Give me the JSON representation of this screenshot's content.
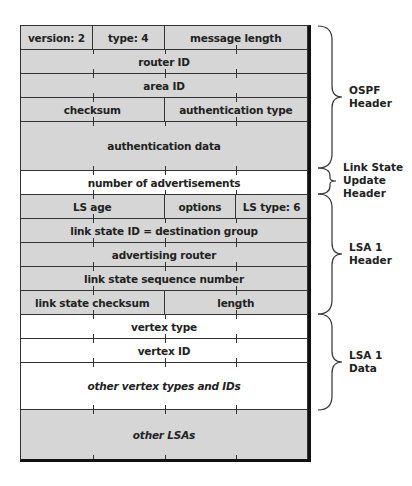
{
  "diagram": {
    "rows": [
      {
        "height": 24,
        "fill": "gray",
        "cells": [
          {
            "label": "version: 2",
            "span": 1
          },
          {
            "label": "type: 4",
            "span": 1
          },
          {
            "label": "message length",
            "span": 2
          }
        ]
      },
      {
        "height": 24,
        "fill": "gray",
        "cells": [
          {
            "label": "router ID",
            "span": 4
          }
        ]
      },
      {
        "height": 24,
        "fill": "gray",
        "cells": [
          {
            "label": "area ID",
            "span": 4
          }
        ]
      },
      {
        "height": 24,
        "fill": "gray",
        "cells": [
          {
            "label": "checksum",
            "span": 2
          },
          {
            "label": "authentication type",
            "span": 2
          }
        ]
      },
      {
        "height": 49,
        "fill": "gray",
        "cells": [
          {
            "label": "authentication data",
            "span": 4
          }
        ]
      },
      {
        "height": 24,
        "fill": "white",
        "cells": [
          {
            "label": "number of advertisements",
            "span": 4
          }
        ]
      },
      {
        "height": 24,
        "fill": "gray",
        "cells": [
          {
            "label": "LS age",
            "span": 2
          },
          {
            "label": "options",
            "span": 1
          },
          {
            "label": "LS type: 6",
            "span": 1
          }
        ]
      },
      {
        "height": 24,
        "fill": "gray",
        "cells": [
          {
            "label": "link state ID = destination group",
            "span": 4
          }
        ]
      },
      {
        "height": 24,
        "fill": "gray",
        "cells": [
          {
            "label": "advertising router",
            "span": 4
          }
        ]
      },
      {
        "height": 24,
        "fill": "gray",
        "cells": [
          {
            "label": "link state sequence number",
            "span": 4
          }
        ]
      },
      {
        "height": 24,
        "fill": "gray",
        "cells": [
          {
            "label": "link state checksum",
            "span": 2
          },
          {
            "label": "length",
            "span": 2
          }
        ]
      },
      {
        "height": 24,
        "fill": "white",
        "cells": [
          {
            "label": "vertex type",
            "span": 4
          }
        ]
      },
      {
        "height": 24,
        "fill": "white",
        "cells": [
          {
            "label": "vertex ID",
            "span": 4
          }
        ]
      },
      {
        "height": 47,
        "fill": "white",
        "cells": [
          {
            "label": "other vertex types and IDs",
            "span": 4,
            "italic": true
          }
        ]
      },
      {
        "height": 49,
        "fill": "gray",
        "cells": [
          {
            "label": "other LSAs",
            "span": 4,
            "italic": true
          }
        ]
      }
    ],
    "braces": [
      {
        "label_line1": "OSPF",
        "label_line2": "Header",
        "label_line3": ""
      },
      {
        "label_line1": "Link State",
        "label_line2": "Update",
        "label_line3": "Header"
      },
      {
        "label_line1": "LSA 1",
        "label_line2": "Header",
        "label_line3": ""
      },
      {
        "label_line1": "LSA 1",
        "label_line2": "Data",
        "label_line3": ""
      }
    ]
  }
}
